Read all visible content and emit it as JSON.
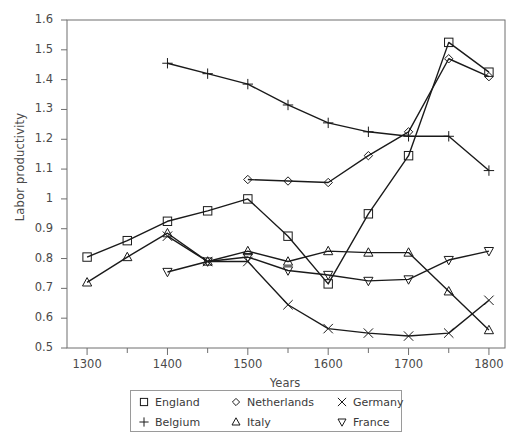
{
  "chart_data": {
    "type": "line",
    "title": "",
    "xlabel": "Years",
    "ylabel": "Labor productivity",
    "xlim": [
      1275,
      1820
    ],
    "ylim": [
      0.5,
      1.6
    ],
    "xticks": [
      1300,
      1400,
      1500,
      1600,
      1700,
      1800
    ],
    "xticklabels": [
      "1300",
      "1400",
      "1500",
      "1600",
      "1700",
      "1800"
    ],
    "xminorticks": [
      1350,
      1450,
      1550,
      1650,
      1750
    ],
    "yticks": [
      0.5,
      0.6,
      0.7,
      0.8,
      0.9,
      1.0,
      1.1,
      1.2,
      1.3,
      1.4,
      1.5,
      1.6
    ],
    "yticklabels": [
      "0.5",
      "0.6",
      "0.7",
      "0.8",
      "0.9",
      "1",
      "1.1",
      "1.2",
      "1.3",
      "1.4",
      "1.5",
      "1.6"
    ],
    "grid": false,
    "legend_position": "below-axes",
    "line_color": "#1a1a1a",
    "series": [
      {
        "name": "England",
        "marker": "square",
        "x": [
          1300,
          1350,
          1400,
          1450,
          1500,
          1550,
          1600,
          1650,
          1700,
          1750,
          1800
        ],
        "values": [
          0.805,
          0.86,
          0.925,
          0.96,
          1.0,
          0.875,
          0.715,
          0.95,
          1.145,
          1.525,
          1.425
        ]
      },
      {
        "name": "Netherlands",
        "marker": "diamond",
        "x": [
          1500,
          1550,
          1600,
          1650,
          1700,
          1750,
          1800
        ],
        "values": [
          1.065,
          1.06,
          1.055,
          1.145,
          1.225,
          1.47,
          1.41
        ]
      },
      {
        "name": "Germany",
        "marker": "cross",
        "x": [
          1400,
          1450,
          1500,
          1550,
          1600,
          1650,
          1700,
          1750,
          1800
        ],
        "values": [
          0.875,
          0.79,
          0.79,
          0.645,
          0.565,
          0.55,
          0.54,
          0.55,
          0.66
        ]
      },
      {
        "name": "Belgium",
        "marker": "plus",
        "x": [
          1400,
          1450,
          1500,
          1550,
          1600,
          1650,
          1700,
          1750,
          1800
        ],
        "values": [
          1.455,
          1.42,
          1.385,
          1.315,
          1.255,
          1.225,
          1.21,
          1.21,
          1.095
        ]
      },
      {
        "name": "Italy",
        "marker": "triangle-up",
        "x": [
          1300,
          1350,
          1400,
          1450,
          1500,
          1550,
          1600,
          1650,
          1700,
          1750,
          1800
        ],
        "values": [
          0.72,
          0.805,
          0.885,
          0.79,
          0.825,
          0.79,
          0.825,
          0.82,
          0.82,
          0.69,
          0.56
        ]
      },
      {
        "name": "France",
        "marker": "triangle-down",
        "x": [
          1400,
          1450,
          1500,
          1550,
          1600,
          1650,
          1700,
          1750,
          1800
        ],
        "values": [
          0.755,
          0.79,
          0.805,
          0.76,
          0.745,
          0.725,
          0.73,
          0.795,
          0.825
        ]
      }
    ]
  },
  "legend": {
    "entries": [
      {
        "label": "England",
        "marker": "square"
      },
      {
        "label": "Netherlands",
        "marker": "diamond"
      },
      {
        "label": "Germany",
        "marker": "cross"
      },
      {
        "label": "Belgium",
        "marker": "plus"
      },
      {
        "label": "Italy",
        "marker": "triangle-up"
      },
      {
        "label": "France",
        "marker": "triangle-down"
      }
    ]
  }
}
